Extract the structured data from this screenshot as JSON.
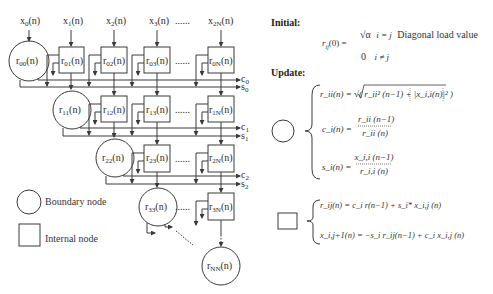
{
  "diagram": {
    "inputs": [
      {
        "label": "x",
        "sub": "0",
        "suffix": "(n)"
      },
      {
        "label": "x",
        "sub": "1",
        "suffix": "(n)"
      },
      {
        "label": "x",
        "sub": "2",
        "suffix": "(n)"
      },
      {
        "label": "x",
        "sub": "3",
        "suffix": "(n)"
      },
      {
        "label": "x",
        "sub": "2N",
        "suffix": "(n)"
      }
    ],
    "ellipsis": "......",
    "rows": [
      {
        "boundary": {
          "label": "r",
          "sub": "00"
        },
        "internal": [
          {
            "sub": "01"
          },
          {
            "sub": "02"
          },
          {
            "sub": "03"
          },
          {
            "sub": "0N"
          }
        ],
        "outputs": [
          {
            "label": "c",
            "sub": "0"
          },
          {
            "label": "s",
            "sub": "0"
          }
        ]
      },
      {
        "boundary": {
          "label": "r",
          "sub": "11"
        },
        "internal": [
          {
            "sub": "12"
          },
          {
            "sub": "13"
          },
          {
            "sub": "1N"
          }
        ],
        "outputs": [
          {
            "label": "c",
            "sub": "1"
          },
          {
            "label": "s",
            "sub": "1"
          }
        ]
      },
      {
        "boundary": {
          "label": "r",
          "sub": "22"
        },
        "internal": [
          {
            "sub": "23"
          },
          {
            "sub": "2N"
          }
        ],
        "outputs": [
          {
            "label": "c",
            "sub": "2"
          },
          {
            "label": "s",
            "sub": "2"
          }
        ]
      },
      {
        "boundary": {
          "label": "r",
          "sub": "33"
        },
        "internal": [
          {
            "sub": "3N"
          }
        ],
        "outputs": []
      }
    ],
    "final": {
      "label": "r",
      "sub": "NN",
      "suffix": "(n)"
    },
    "node_suffix": "(n)"
  },
  "legend": {
    "boundary": "Boundary node",
    "internal": "Internal node"
  },
  "equations": {
    "initial_header": "Initial:",
    "initial_lhs": "r",
    "initial_lhs_sub": "ij",
    "initial_lhs_tail": "(0) =",
    "initial_case1_value": "√α",
    "initial_case1_cond": "i = j",
    "initial_case1_note": "Diagonal load value",
    "initial_case2_value": "0",
    "initial_case2_cond": "i ≠ j",
    "update_header": "Update:",
    "boundary_eq1": "r_ii(n) = √( r_ii² (n−1) + |x_i,i(n)|² )",
    "boundary_eq2_lhs": "c_i(n) =",
    "boundary_eq2_num": "r_ii (n−1)",
    "boundary_eq2_den": "r_ii (n)",
    "boundary_eq3_lhs": "s_i(n) =",
    "boundary_eq3_num": "x_i,i (n−1)",
    "boundary_eq3_den": "r_i,i (n)",
    "internal_eq1": "r_ij(n) = c_i r(n−1) + s_i* x_i,j (n)",
    "internal_eq2": "x_i,j+1(n) = −s_i r_ij(n−1) + c_i x_i,j (n)"
  },
  "colors": {
    "stroke": "#3a3a3a",
    "text": "#2a2a2a",
    "background": "#ffffff"
  }
}
